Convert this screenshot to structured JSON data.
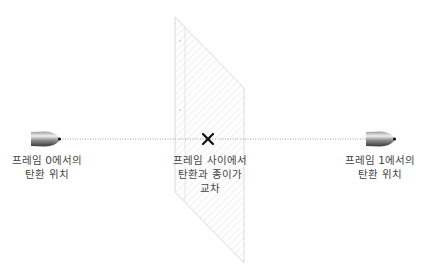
{
  "diagram": {
    "colors": {
      "background": "#ffffff",
      "trajectory_line": "#9a9a9a",
      "paper_outline": "#dcdcdc",
      "paper_hatch": "#e4e4e4",
      "cross_mark": "#111111",
      "label_text": "#444444",
      "bullet_dark": "#555555",
      "bullet_light": "#e8e8e8",
      "bullet_tip": "#111111"
    },
    "nodes": [
      {
        "id": "bullet-frame-0",
        "icon": "bullet-icon",
        "label_lines": [
          "프레임 0에서의",
          "탄환 위치"
        ]
      },
      {
        "id": "intersection",
        "icon": "cross-mark-icon",
        "label_lines": [
          "프레임 사이에서",
          "탄환과 종이가",
          "교차"
        ]
      },
      {
        "id": "bullet-frame-1",
        "icon": "bullet-icon",
        "label_lines": [
          "프레임 1에서의",
          "탄환 위치"
        ]
      }
    ],
    "edges": [
      {
        "from": "bullet-frame-0",
        "to": "bullet-frame-1",
        "style": "dotted",
        "passes_through": "paper-sheet"
      }
    ],
    "objects": [
      {
        "id": "paper-sheet",
        "shape": "parallelogram",
        "fill": "diagonal-hatch"
      }
    ]
  }
}
